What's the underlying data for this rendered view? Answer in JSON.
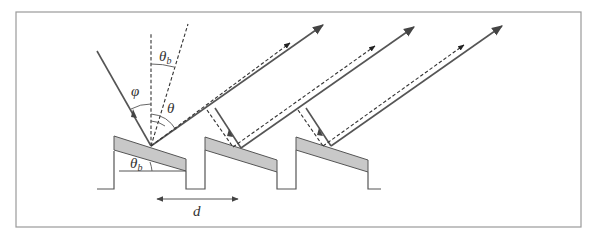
{
  "figure": {
    "labels": {
      "phi": "φ",
      "theta": "θ",
      "theta_b_main": "θ",
      "theta_b_sub": "b",
      "theta_b_lower": "θ",
      "theta_b_lower_sub": "b",
      "period": "d"
    },
    "grating": {
      "grooves": 3,
      "facet_color": "#c8c8c8",
      "line_color": "#555555"
    },
    "rays": {
      "incident_style": "solid-with-arrow",
      "diffracted_style": "solid-with-arrow",
      "specular_style": "dashed-with-arrow",
      "normal_style": "dashed"
    }
  }
}
